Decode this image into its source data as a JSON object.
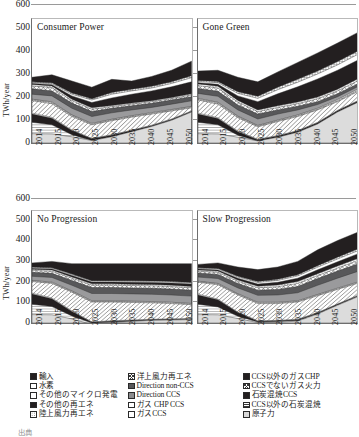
{
  "figure": {
    "ylabel": "TWh/year",
    "caption": "出典"
  },
  "chart_data": {
    "type": "area",
    "title": "",
    "xlabel": "",
    "ylabel": "TWh/year",
    "ylim": [
      0,
      600
    ],
    "yticks": [
      0,
      100,
      200,
      300,
      400,
      500,
      600
    ],
    "grid": true,
    "legend_position": "bottom",
    "x": [
      2014,
      2015,
      2020,
      2025,
      2030,
      2035,
      2040,
      2045,
      2050
    ],
    "xtick_labels": [
      "2014",
      "2015",
      "2020",
      "2025",
      "2030",
      "2035",
      "2040",
      "2045",
      "2050"
    ],
    "stack_order": [
      "nuclear",
      "coal_cofire_non_ccs",
      "coal_cofire_ccs",
      "gas_non_ccs",
      "gas_chp_non_ccs",
      "gas_ccs",
      "gas_chp_ccs",
      "direction_ccs",
      "direction_non_ccs",
      "offshore_wind",
      "onshore_wind",
      "other_renewables",
      "other_micro_gen",
      "hydrogen",
      "imports"
    ],
    "panels": [
      {
        "id": "consumer-power",
        "title": "Consumer Power",
        "row": 0,
        "col": 0,
        "series": [
          {
            "name": "nuclear",
            "values": [
              45,
              44,
              30,
              12,
              30,
              55,
              80,
              110,
              150
            ]
          },
          {
            "name": "coal_cofire_non_ccs",
            "values": [
              100,
              88,
              40,
              12,
              30,
              55,
              80,
              110,
              150
            ]
          },
          {
            "name": "coal_cofire_ccs",
            "values": [
              140,
              120,
              60,
              20,
              38,
              60,
              84,
              114,
              153
            ]
          },
          {
            "name": "gas_non_ccs",
            "values": [
              145,
              124,
              63,
              22,
              40,
              62,
              86,
              116,
              155
            ]
          },
          {
            "name": "gas_chp_non_ccs",
            "values": [
              205,
              190,
              128,
              88,
              108,
              125,
              140,
              155,
              170
            ]
          },
          {
            "name": "gas_ccs",
            "values": [
              210,
              196,
              133,
              92,
              112,
              129,
              144,
              159,
              174
            ]
          },
          {
            "name": "gas_chp_ccs",
            "values": [
              212,
              199,
              136,
              95,
              115,
              132,
              147,
              162,
              177
            ]
          },
          {
            "name": "direction_ccs",
            "values": [
              236,
              228,
              168,
              128,
              146,
              160,
              172,
              188,
              204
            ]
          },
          {
            "name": "direction_non_ccs",
            "values": [
              262,
              252,
              193,
              152,
              168,
              180,
              192,
              208,
              224
            ]
          },
          {
            "name": "offshore_wind",
            "values": [
              276,
              268,
              205,
              163,
              176,
              188,
              200,
              215,
              232
            ]
          },
          {
            "name": "onshore_wind",
            "values": [
              283,
              276,
              212,
              170,
              182,
              193,
              205,
              220,
              238
            ]
          },
          {
            "name": "other_renewables",
            "values": [
              288,
              282,
              228,
              196,
              218,
              236,
              252,
              272,
              296
            ]
          },
          {
            "name": "other_micro_gen",
            "values": [
              292,
              287,
              236,
              208,
              236,
              252,
              266,
              288,
              316
            ]
          },
          {
            "name": "hydrogen",
            "values": [
              296,
              292,
              242,
              214,
              244,
              260,
              274,
              296,
              326
            ]
          },
          {
            "name": "imports",
            "values": [
              318,
              330,
              300,
              270,
              308,
              300,
              322,
              352,
              396
            ]
          }
        ]
      },
      {
        "id": "gone-green",
        "title": "Gone Green",
        "row": 0,
        "col": 1,
        "series": [
          {
            "name": "nuclear",
            "values": [
              45,
              44,
              28,
              10,
              28,
              52,
              92,
              150,
              196
            ]
          },
          {
            "name": "coal_cofire_non_ccs",
            "values": [
              100,
              88,
              38,
              10,
              28,
              52,
              92,
              150,
              196
            ]
          },
          {
            "name": "coal_cofire_ccs",
            "values": [
              140,
              118,
              55,
              16,
              34,
              58,
              98,
              156,
              202
            ]
          },
          {
            "name": "gas_non_ccs",
            "values": [
              145,
              122,
              58,
              18,
              36,
              60,
              100,
              158,
              204
            ]
          },
          {
            "name": "gas_chp_non_ccs",
            "values": [
              208,
              188,
              122,
              78,
              104,
              128,
              160,
              200,
              248
            ]
          },
          {
            "name": "gas_ccs",
            "values": [
              213,
              194,
              127,
              82,
              108,
              132,
              164,
              205,
              254
            ]
          },
          {
            "name": "gas_chp_ccs",
            "values": [
              216,
              197,
              130,
              85,
              111,
              136,
              168,
              210,
              260
            ]
          },
          {
            "name": "direction_ccs",
            "values": [
              240,
              226,
              160,
              116,
              140,
              160,
              186,
              224,
              272
            ]
          },
          {
            "name": "direction_non_ccs",
            "values": [
              264,
              250,
              184,
              140,
              160,
              178,
              200,
              238,
              286
            ]
          },
          {
            "name": "offshore_wind",
            "values": [
              278,
              266,
              198,
              152,
              172,
              190,
              214,
              252,
              300
            ]
          },
          {
            "name": "onshore_wind",
            "values": [
              286,
              275,
              206,
              160,
              180,
              198,
              222,
              260,
              310
            ]
          },
          {
            "name": "other_renewables",
            "values": [
              292,
              284,
              228,
              200,
              238,
              272,
              310,
              352,
              400
            ]
          },
          {
            "name": "other_micro_gen",
            "values": [
              298,
              292,
              240,
              216,
              258,
              294,
              334,
              378,
              428
            ]
          },
          {
            "name": "hydrogen",
            "values": [
              303,
              298,
              248,
              226,
              270,
              308,
              348,
              394,
              444
            ]
          },
          {
            "name": "imports",
            "values": [
              348,
              352,
              318,
              296,
              344,
              390,
              436,
              484,
              534
            ]
          }
        ]
      },
      {
        "id": "no-progression",
        "title": "No Progression",
        "row": 1,
        "col": 0,
        "series": [
          {
            "name": "nuclear",
            "values": [
              45,
              44,
              22,
              -8,
              2,
              8,
              14,
              16,
              18
            ]
          },
          {
            "name": "coal_cofire_non_ccs",
            "values": [
              100,
              88,
              38,
              0,
              6,
              10,
              16,
              18,
              20
            ]
          },
          {
            "name": "coal_cofire_ccs",
            "values": [
              155,
              130,
              62,
              4,
              10,
              14,
              18,
              20,
              22
            ]
          },
          {
            "name": "gas_non_ccs",
            "values": [
              160,
              134,
              65,
              6,
              12,
              16,
              20,
              22,
              24
            ]
          },
          {
            "name": "gas_chp_non_ccs",
            "values": [
              222,
              212,
              165,
              112,
              112,
              110,
              108,
              104,
              98
            ]
          },
          {
            "name": "gas_ccs",
            "values": [
              226,
              216,
              169,
              116,
              116,
              114,
              112,
              108,
              102
            ]
          },
          {
            "name": "gas_chp_ccs",
            "values": [
              228,
              219,
              172,
              119,
              119,
              117,
              115,
              111,
              105
            ]
          },
          {
            "name": "direction_ccs",
            "values": [
              250,
              244,
              202,
              158,
              158,
              156,
              154,
              150,
              144
            ]
          },
          {
            "name": "direction_non_ccs",
            "values": [
              272,
              266,
              228,
              190,
              190,
              188,
              186,
              182,
              176
            ]
          },
          {
            "name": "offshore_wind",
            "values": [
              282,
              277,
              240,
              203,
              203,
              201,
              199,
              195,
              189
            ]
          },
          {
            "name": "onshore_wind",
            "values": [
              288,
              284,
              247,
              210,
              210,
              208,
              206,
              202,
              196
            ]
          },
          {
            "name": "other_renewables",
            "values": [
              292,
              289,
              254,
              219,
              219,
              218,
              217,
              214,
              209
            ]
          },
          {
            "name": "other_micro_gen",
            "values": [
              296,
              293,
              259,
              224,
              224,
              223,
              222,
              219,
              214
            ]
          },
          {
            "name": "hydrogen",
            "values": [
              299,
              296,
              262,
              227,
              227,
              226,
              225,
              222,
              217
            ]
          },
          {
            "name": "imports",
            "values": [
              322,
              330,
              318,
              318,
              318,
              318,
              318,
              318,
              318
            ]
          }
        ]
      },
      {
        "id": "slow-progression",
        "title": "Slow Progression",
        "row": 1,
        "col": 1,
        "series": [
          {
            "name": "nuclear",
            "values": [
              45,
              44,
              24,
              2,
              4,
              10,
              48,
              95,
              140
            ]
          },
          {
            "name": "coal_cofire_non_ccs",
            "values": [
              100,
              86,
              36,
              6,
              8,
              14,
              50,
              97,
              142
            ]
          },
          {
            "name": "coal_cofire_ccs",
            "values": [
              150,
              124,
              56,
              10,
              12,
              18,
              54,
              100,
              145
            ]
          },
          {
            "name": "gas_non_ccs",
            "values": [
              155,
              128,
              58,
              12,
              14,
              20,
              56,
              102,
              148
            ]
          },
          {
            "name": "gas_chp_non_ccs",
            "values": [
              218,
              205,
              150,
              104,
              104,
              112,
              146,
              180,
              212
            ]
          },
          {
            "name": "gas_ccs",
            "values": [
              222,
              209,
              154,
              108,
              108,
              116,
              150,
              184,
              216
            ]
          },
          {
            "name": "gas_chp_ccs",
            "values": [
              224,
              212,
              157,
              111,
              111,
              119,
              153,
              187,
              219
            ]
          },
          {
            "name": "direction_ccs",
            "values": [
              246,
              238,
              188,
              148,
              150,
              162,
              202,
              240,
              276
            ]
          },
          {
            "name": "direction_non_ccs",
            "values": [
              268,
              260,
              212,
              176,
              180,
              196,
              238,
              278,
              316
            ]
          },
          {
            "name": "offshore_wind",
            "values": [
              278,
              271,
              224,
              189,
              194,
              212,
              254,
              294,
              334
            ]
          },
          {
            "name": "onshore_wind",
            "values": [
              284,
              278,
              231,
              197,
              203,
              222,
              264,
              305,
              345
            ]
          },
          {
            "name": "other_renewables",
            "values": [
              289,
              284,
              240,
              209,
              218,
              240,
              285,
              328,
              370
            ]
          },
          {
            "name": "other_micro_gen",
            "values": [
              293,
              289,
              246,
              217,
              228,
              252,
              299,
              343,
              386
            ]
          },
          {
            "name": "hydrogen",
            "values": [
              296,
              292,
              250,
              222,
              234,
              259,
              307,
              352,
              396
            ]
          },
          {
            "name": "imports",
            "values": [
              314,
              322,
              300,
              286,
              300,
              330,
              392,
              442,
              486
            ]
          }
        ]
      }
    ]
  },
  "legend": {
    "columns": [
      {
        "items": [
          {
            "label": "輸入",
            "fill": "f-black"
          },
          {
            "label": "水素",
            "fill": "f-grid"
          },
          {
            "label": "その他のマイクロ発電",
            "fill": "f-white"
          },
          {
            "label": "その他の再エネ",
            "fill": "f-black"
          },
          {
            "label": "陸上風力再エネ",
            "fill": "f-dots"
          }
        ]
      },
      {
        "items": [
          {
            "label": "洋上風力再エネ",
            "fill": "f-cross"
          },
          {
            "label": "Direction non-CCS",
            "fill": "f-dgray"
          },
          {
            "label": "Direction CCS",
            "fill": "f-mgray"
          },
          {
            "label": "ガス CHP CCS",
            "fill": "f-white"
          },
          {
            "label": "ガスCCS",
            "fill": "f-grid"
          }
        ]
      },
      {
        "items": [
          {
            "label": "CCS以外のガスCHP",
            "fill": "f-black"
          },
          {
            "label": "CCSでないガス火力",
            "fill": "f-cross"
          },
          {
            "label": "石炭混焼CCS",
            "fill": "f-black"
          },
          {
            "label": "CCS以外の石炭混焼",
            "fill": "f-hlines"
          },
          {
            "label": "原子力",
            "fill": "f-lgray"
          }
        ]
      }
    ]
  }
}
